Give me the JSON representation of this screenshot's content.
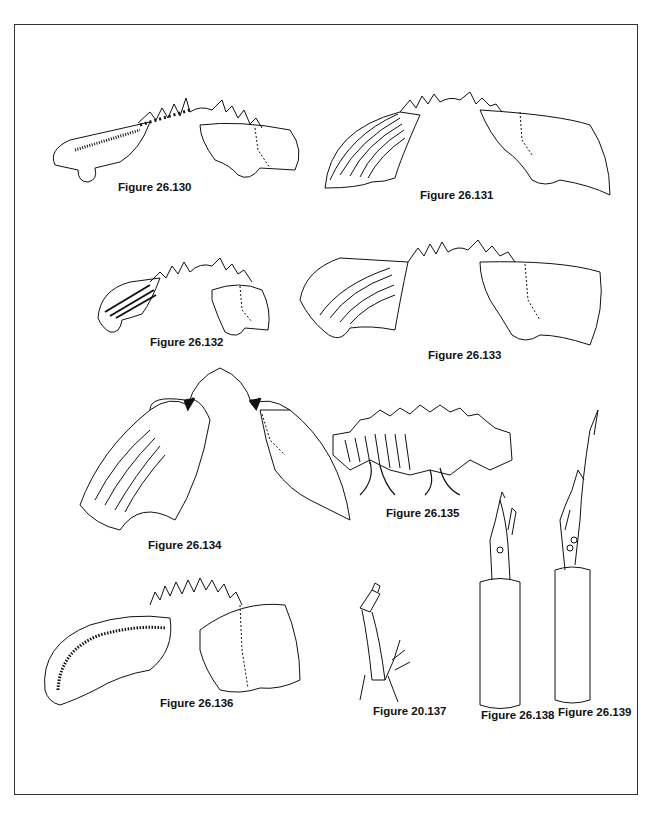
{
  "page": {
    "frame_color": "#333333",
    "ink_color": "#111111"
  },
  "figures": [
    {
      "id": "fig-130",
      "label": "Figure 26.130"
    },
    {
      "id": "fig-131",
      "label": "Figure 26.131"
    },
    {
      "id": "fig-132",
      "label": "Figure 26.132"
    },
    {
      "id": "fig-133",
      "label": "Figure 26.133"
    },
    {
      "id": "fig-134",
      "label": "Figure 26.134"
    },
    {
      "id": "fig-135",
      "label": "Figure 26.135"
    },
    {
      "id": "fig-136",
      "label": "Figure 26.136"
    },
    {
      "id": "fig-137",
      "label": "Figure 20.137"
    },
    {
      "id": "fig-138",
      "label": "Figure 26.138"
    },
    {
      "id": "fig-139",
      "label": "Figure 26.139"
    }
  ]
}
